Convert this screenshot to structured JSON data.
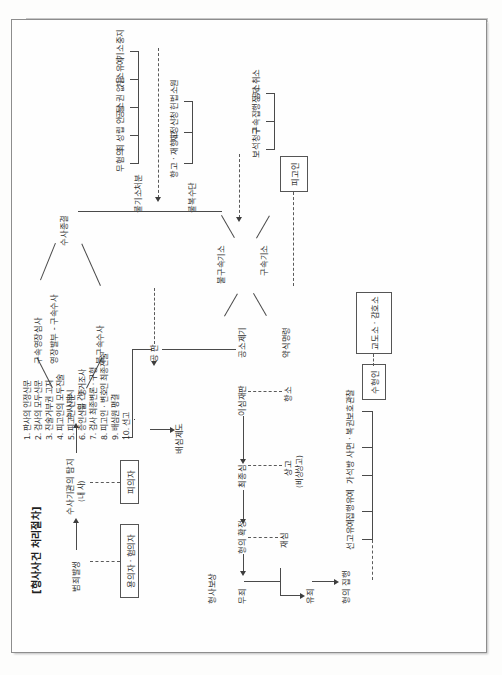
{
  "document": {
    "title": "[형사사건 처리절차]",
    "type": "criminal-procedure-flowchart",
    "orientation": "rotated-90-clockwise-scan"
  },
  "flow": {
    "start": "범죄발생",
    "stage_investigation_notice": "수사기관의 탐지",
    "stage_investigation_notice_sub": "(내 사)",
    "stage_investigation_open": "수사개시",
    "stage_investigation_open_sub": "(입 건)",
    "branch_detained": "구속영장심사",
    "branch_warrant": "영장발부 - 구속수사",
    "branch_nondetained": "불구속수사",
    "stage_investigation_end": "수사종결",
    "stage_prosecution_detained": "불구속기소",
    "stage_prosecution_detained2": "구속기소",
    "stage_summary": "공소제기",
    "stage_summary_order": "약식명령",
    "stage_trial": "공 판",
    "stage_jury": "배심제도",
    "stage_first_trial": "이심재판",
    "stage_final": "최종심",
    "stage_confirm": "형의 확정",
    "stage_not_guilty": "무죄",
    "stage_guilty": "유죄",
    "stage_execution": "형의 집행",
    "stage_compensation": "형사보상"
  },
  "nonprosecution": {
    "header": "불기소처분",
    "items": [
      "무혐의",
      "죄 성립 안 됨",
      "공소권 없음",
      "기소유예",
      "기소중지"
    ]
  },
  "appeal_means": {
    "header": "불복수단",
    "items": [
      "항고 · 재항고",
      "재정신청",
      "헌법소원"
    ]
  },
  "defendant_rights": {
    "items": [
      "보석청구",
      "구속집행정지",
      "공소취소"
    ]
  },
  "suspended": {
    "items": [
      "선고유예",
      "집행유예",
      "가석방",
      "사면 · 복권",
      "보호관찰"
    ]
  },
  "appeals": {
    "first": "항소",
    "second": "상고",
    "second_sub": "(비상상고)",
    "retrial": "재심"
  },
  "actors": [
    {
      "label": "용의자 · 혐의자",
      "name": "suspect-box"
    },
    {
      "label": "피의자",
      "name": "accused-box"
    },
    {
      "label": "피고인",
      "name": "defendant-box"
    },
    {
      "label": "수형인",
      "name": "convict-box"
    },
    {
      "label": "교도소 · 감호소",
      "name": "prison-box"
    }
  ],
  "trial_steps": {
    "items": [
      "1. 판사의 인정신문",
      "2. 검사의 모두신문",
      "3. 진술거부권 고지",
      "4. 피고인의 모두진술",
      "5. 피고인 신문",
      "6. 증인신문 · 증거조사",
      "7. 검사 최종변론 · 구형",
      "8. 피고인 · 변호인 최종진술",
      "9. 배심원 평결",
      "10. 선고"
    ]
  },
  "colors": {
    "ink": "#2c2c2c",
    "line": "#4a4a4a",
    "paper": "#fefefe"
  }
}
